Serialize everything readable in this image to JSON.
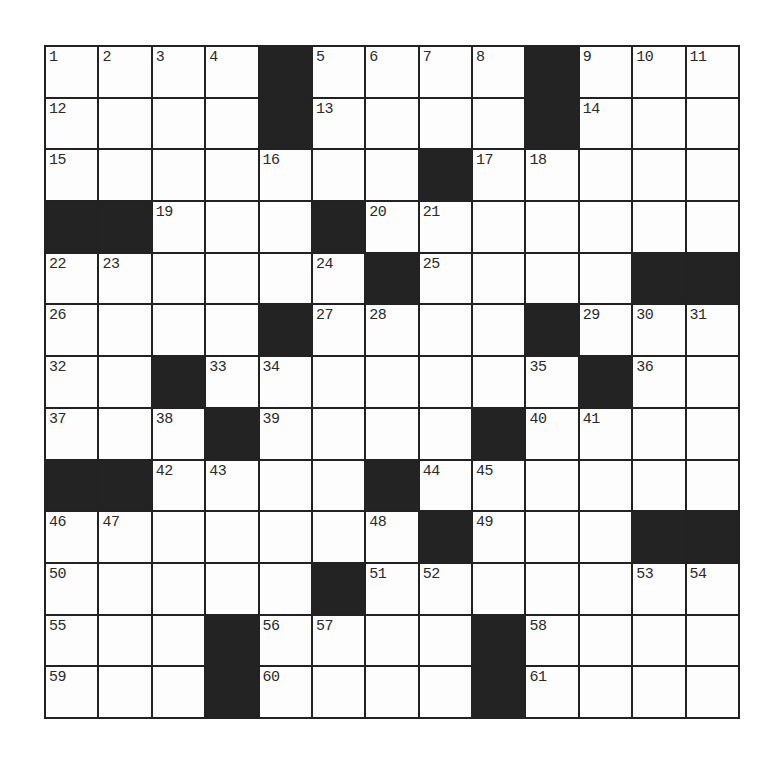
{
  "puzzle": {
    "rows": 13,
    "cols": 13,
    "colors": {
      "block": "#232323",
      "cell": "#fdfdfd",
      "line": "#222222",
      "number": "#2a2a2a"
    },
    "grid": [
      [
        "1",
        "2",
        "3",
        "4",
        "#",
        "5",
        "6",
        "7",
        "8",
        "#",
        "9",
        "10",
        "11"
      ],
      [
        "12",
        "",
        "",
        "",
        "#",
        "13",
        "",
        "",
        "",
        "#",
        "14",
        "",
        ""
      ],
      [
        "15",
        "",
        "",
        "",
        "16",
        "",
        "",
        "#",
        "17",
        "18",
        "",
        "",
        ""
      ],
      [
        "#",
        "#",
        "19",
        "",
        "",
        "#",
        "20",
        "21",
        "",
        "",
        "",
        "",
        ""
      ],
      [
        "22",
        "23",
        "",
        "",
        "",
        "24",
        "#",
        "25",
        "",
        "",
        "",
        "#",
        "#"
      ],
      [
        "26",
        "",
        "",
        "",
        "#",
        "27",
        "28",
        "",
        "",
        "#",
        "29",
        "30",
        "31"
      ],
      [
        "32",
        "",
        "#",
        "33",
        "34",
        "",
        "",
        "",
        "",
        "35",
        "#",
        "36",
        ""
      ],
      [
        "37",
        "",
        "38",
        "#",
        "39",
        "",
        "",
        "",
        "#",
        "40",
        "41",
        "",
        ""
      ],
      [
        "#",
        "#",
        "42",
        "43",
        "",
        "",
        "#",
        "44",
        "45",
        "",
        "",
        "",
        ""
      ],
      [
        "46",
        "47",
        "",
        "",
        "",
        "",
        "48",
        "#",
        "49",
        "",
        "",
        "#",
        "#"
      ],
      [
        "50",
        "",
        "",
        "",
        "",
        "#",
        "51",
        "52",
        "",
        "",
        "",
        "53",
        "54"
      ],
      [
        "55",
        "",
        "",
        "#",
        "56",
        "57",
        "",
        "",
        "#",
        "58",
        "",
        "",
        ""
      ],
      [
        "59",
        "",
        "",
        "#",
        "60",
        "",
        "",
        "",
        "#",
        "61",
        "",
        "",
        ""
      ]
    ]
  }
}
